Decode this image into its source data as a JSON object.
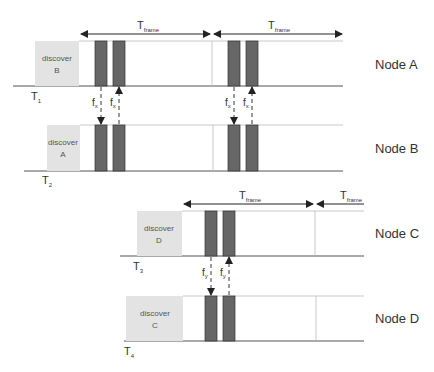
{
  "diagram": {
    "type": "timing-diagram",
    "colors": {
      "discover_fill": "#e3e3e3",
      "slot_fill": "#666666",
      "line": "#555555",
      "frame_border": "#bbbbbb"
    },
    "frame_label": {
      "main": "T",
      "sub": "frame"
    },
    "nodes": [
      {
        "id": "A",
        "label": "Node A",
        "discover": [
          "discover",
          "B"
        ],
        "time": {
          "main": "T",
          "sub": "1"
        }
      },
      {
        "id": "B",
        "label": "Node B",
        "discover": [
          "discover",
          "A"
        ],
        "time": {
          "main": "T",
          "sub": "2"
        }
      },
      {
        "id": "C",
        "label": "Node C",
        "discover": [
          "discover",
          "D"
        ],
        "time": {
          "main": "T",
          "sub": "3"
        }
      },
      {
        "id": "D",
        "label": "Node D",
        "discover": [
          "discover",
          "C"
        ],
        "time": {
          "main": "T",
          "sub": "4"
        }
      }
    ],
    "messages": [
      {
        "label_main": "f",
        "label_sub": "x",
        "from": "A",
        "to": "B",
        "frame": 1,
        "slot": 1
      },
      {
        "label_main": "f",
        "label_sub": "x",
        "from": "B",
        "to": "A",
        "frame": 1,
        "slot": 2
      },
      {
        "label_main": "f",
        "label_sub": "x",
        "from": "A",
        "to": "B",
        "frame": 2,
        "slot": 1
      },
      {
        "label_main": "f",
        "label_sub": "x",
        "from": "B",
        "to": "A",
        "frame": 2,
        "slot": 2
      },
      {
        "label_main": "f",
        "label_sub": "y",
        "from": "C",
        "to": "D",
        "frame": 1,
        "slot": 1
      },
      {
        "label_main": "f",
        "label_sub": "y",
        "from": "D",
        "to": "C",
        "frame": 1,
        "slot": 2
      }
    ]
  }
}
